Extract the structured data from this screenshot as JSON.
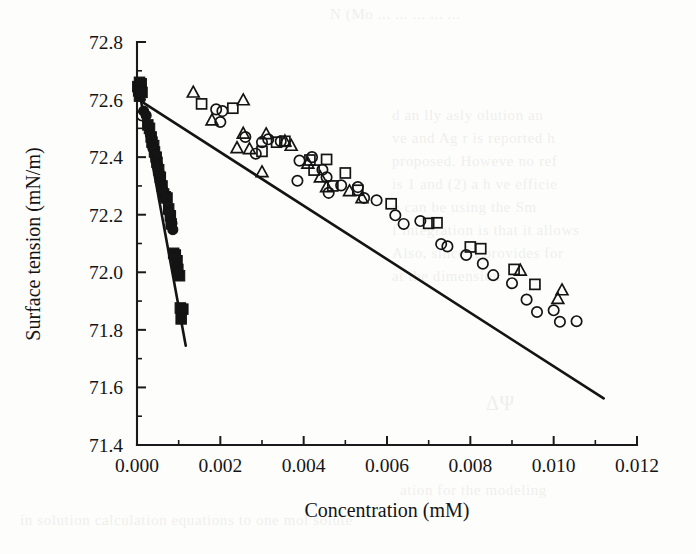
{
  "figure": {
    "background_color": "#fdfdfb",
    "ink_color": "#141414"
  },
  "bleed_text": {
    "note": "faint show-through text from the reverse side of the printed page",
    "right_block_lines": [
      "d  an  lly  asly  olution  an",
      "ve  and  Ag  r  is  reported  h",
      "proposed.  Howeve   no  ref",
      "is 1 and (2) a  h  ve  efficie",
      "n  can  be  using  the  Sm",
      "f  integration  is  that  it  allows",
      "Also,   since    it    provides    for",
      "at  the  dimension"
    ],
    "top_line": "N (Mo   ... ...  ... ... ...",
    "right_formula": "ΔΨ",
    "bottom_line": "ation for the modeling",
    "bottom_line2": "in solution calculation  equations  to  one  mol solute"
  },
  "chart_data": {
    "type": "scatter",
    "title": "",
    "xlabel": "Concentration (mM)",
    "ylabel": "Surface tension (mN/m)",
    "xlim": [
      0.0,
      0.012
    ],
    "ylim": [
      71.4,
      72.8
    ],
    "xticks": [
      0.0,
      0.002,
      0.004,
      0.006,
      0.008,
      0.01,
      0.012
    ],
    "xticklabels": [
      "0.000",
      "0.002",
      "0.004",
      "0.006",
      "0.008",
      "0.010",
      "0.012"
    ],
    "yticks": [
      71.4,
      71.6,
      71.8,
      72.0,
      72.2,
      72.4,
      72.6,
      72.8
    ],
    "yticklabels": [
      "71.4",
      "71.6",
      "71.8",
      "72.0",
      "72.2",
      "72.4",
      "72.6",
      "72.8"
    ],
    "x_minor_ticks": [
      0.001,
      0.003,
      0.005,
      0.007,
      0.009,
      0.011
    ],
    "y_minor_ticks": [
      71.5,
      71.7,
      71.9,
      72.1,
      72.3,
      72.5,
      72.7
    ],
    "grid": false,
    "legend": "none",
    "series": [
      {
        "name": "filled-squares",
        "marker": "filled-square",
        "points": [
          [
            2e-05,
            72.645
          ],
          [
            4e-05,
            72.63
          ],
          [
            6e-05,
            72.66
          ],
          [
            6e-05,
            72.612
          ],
          [
            8e-05,
            72.64
          ],
          [
            0.0001,
            72.655
          ],
          [
            0.00012,
            72.625
          ],
          [
            0.00026,
            72.512
          ],
          [
            0.0003,
            72.5
          ],
          [
            0.00034,
            72.47
          ],
          [
            0.00036,
            72.452
          ],
          [
            0.0004,
            72.44
          ],
          [
            0.00042,
            72.418
          ],
          [
            0.00046,
            72.4
          ],
          [
            0.00048,
            72.382
          ],
          [
            0.00052,
            72.356
          ],
          [
            0.00056,
            72.33
          ],
          [
            0.0006,
            72.3
          ],
          [
            0.00064,
            72.272
          ],
          [
            0.00068,
            72.262
          ],
          [
            0.00072,
            72.258
          ],
          [
            0.00076,
            72.22
          ],
          [
            0.0008,
            72.196
          ],
          [
            0.00082,
            72.168
          ],
          [
            0.00088,
            72.066
          ],
          [
            0.00092,
            72.06
          ],
          [
            0.00096,
            72.04
          ],
          [
            0.00098,
            72.01
          ],
          [
            0.00102,
            71.988
          ],
          [
            0.00104,
            71.876
          ],
          [
            0.0011,
            71.872
          ],
          [
            0.00106,
            71.838
          ]
        ]
      },
      {
        "name": "filled-circles",
        "marker": "filled-circle",
        "points": [
          [
            0.00016,
            72.56
          ],
          [
            0.00022,
            72.545
          ],
          [
            0.00032,
            72.478
          ],
          [
            0.00038,
            72.432
          ],
          [
            0.00044,
            72.408
          ],
          [
            0.0005,
            72.372
          ],
          [
            0.00054,
            72.344
          ],
          [
            0.00062,
            72.286
          ],
          [
            0.0007,
            72.258
          ],
          [
            0.00078,
            72.208
          ],
          [
            0.00084,
            72.17
          ],
          [
            0.00086,
            72.148
          ],
          [
            0.00094,
            72.052
          ],
          [
            0.001,
            71.998
          ]
        ]
      },
      {
        "name": "open-circles",
        "marker": "open-circle",
        "points": [
          [
            0.00012,
            72.545
          ],
          [
            0.0019,
            72.566
          ],
          [
            0.00205,
            72.56
          ],
          [
            0.002,
            72.522
          ],
          [
            0.0026,
            72.47
          ],
          [
            0.003,
            72.452
          ],
          [
            0.00315,
            72.462
          ],
          [
            0.00345,
            72.455
          ],
          [
            0.00285,
            72.412
          ],
          [
            0.0039,
            72.388
          ],
          [
            0.0042,
            72.4
          ],
          [
            0.00445,
            72.356
          ],
          [
            0.00455,
            72.33
          ],
          [
            0.00385,
            72.318
          ],
          [
            0.0049,
            72.302
          ],
          [
            0.0053,
            72.296
          ],
          [
            0.0046,
            72.276
          ],
          [
            0.00545,
            72.258
          ],
          [
            0.00575,
            72.25
          ],
          [
            0.0062,
            72.198
          ],
          [
            0.0068,
            72.178
          ],
          [
            0.0064,
            72.168
          ],
          [
            0.0073,
            72.098
          ],
          [
            0.00745,
            72.09
          ],
          [
            0.0079,
            72.06
          ],
          [
            0.0083,
            72.03
          ],
          [
            0.00855,
            71.99
          ],
          [
            0.009,
            71.962
          ],
          [
            0.00935,
            71.905
          ],
          [
            0.0096,
            71.862
          ],
          [
            0.01,
            71.868
          ],
          [
            0.01015,
            71.828
          ],
          [
            0.01055,
            71.83
          ]
        ]
      },
      {
        "name": "open-squares",
        "marker": "open-square",
        "points": [
          [
            0.00155,
            72.585
          ],
          [
            0.0023,
            72.57
          ],
          [
            0.00335,
            72.452
          ],
          [
            0.00355,
            72.455
          ],
          [
            0.003,
            72.42
          ],
          [
            0.00415,
            72.39
          ],
          [
            0.00455,
            72.392
          ],
          [
            0.00425,
            72.355
          ],
          [
            0.005,
            72.345
          ],
          [
            0.0047,
            72.3
          ],
          [
            0.0053,
            72.285
          ],
          [
            0.0061,
            72.238
          ],
          [
            0.007,
            72.17
          ],
          [
            0.0072,
            72.172
          ],
          [
            0.008,
            72.088
          ],
          [
            0.00825,
            72.082
          ],
          [
            0.00905,
            72.01
          ],
          [
            0.00955,
            71.958
          ]
        ]
      },
      {
        "name": "open-triangles",
        "marker": "open-triangle",
        "points": [
          [
            0.00135,
            72.625
          ],
          [
            0.00255,
            72.598
          ],
          [
            0.0018,
            72.528
          ],
          [
            0.00255,
            72.482
          ],
          [
            0.0031,
            72.48
          ],
          [
            0.0024,
            72.432
          ],
          [
            0.0027,
            72.428
          ],
          [
            0.00355,
            72.455
          ],
          [
            0.0037,
            72.44
          ],
          [
            0.003,
            72.348
          ],
          [
            0.0041,
            72.378
          ],
          [
            0.0044,
            72.33
          ],
          [
            0.00455,
            72.296
          ],
          [
            0.0051,
            72.282
          ],
          [
            0.0054,
            72.258
          ],
          [
            0.0092,
            72.006
          ],
          [
            0.0102,
            71.938
          ],
          [
            0.0101,
            71.908
          ]
        ]
      }
    ],
    "fit_lines": [
      {
        "name": "main-fit-line",
        "description": "shallow regression line through open markers",
        "x": [
          0.0,
          0.0112
        ],
        "y": [
          72.603,
          71.562
        ]
      },
      {
        "name": "steep-fit-line",
        "description": "steep regression line through filled markers",
        "x": [
          8e-05,
          0.00117
        ],
        "y": [
          72.608,
          71.745
        ]
      }
    ]
  }
}
